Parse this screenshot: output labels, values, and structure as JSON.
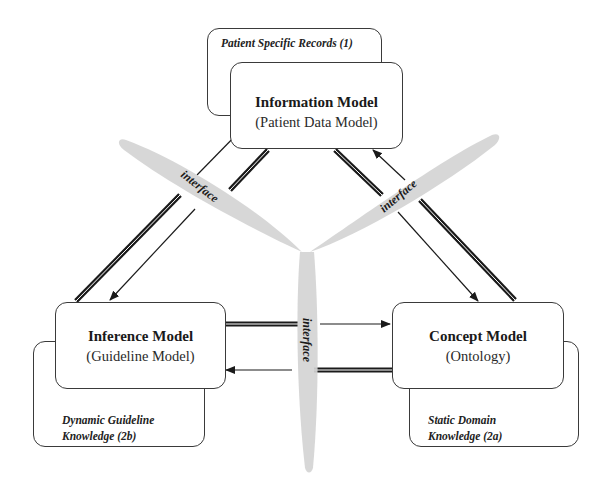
{
  "diagram": {
    "models": {
      "information": {
        "title": "Information Model",
        "subtitle": "(Patient Data Model)",
        "knowledge": "Patient Specific Records (1)"
      },
      "inference": {
        "title": "Inference Model",
        "subtitle": "(Guideline Model)",
        "knowledge_line1": "Dynamic Guideline",
        "knowledge_line2": "Knowledge (2b)"
      },
      "concept": {
        "title": "Concept Model",
        "subtitle": "(Ontology)",
        "knowledge_line1": "Static Domain",
        "knowledge_line2": "Knowledge  (2a)"
      }
    },
    "interfaces": {
      "left": "interface",
      "right": "interface",
      "bottom": "interface"
    },
    "colors": {
      "line": "#1a1a1a",
      "blade": "#d4d4d4",
      "box_border": "#3a3a3a"
    }
  }
}
